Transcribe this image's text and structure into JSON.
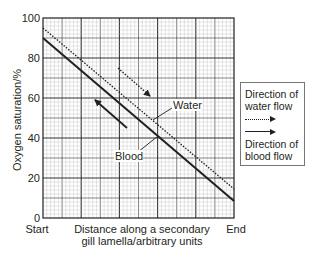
{
  "chart_data": {
    "type": "line",
    "title": "",
    "xlabel": "Distance along a secondary gill lamella/arbitrary units",
    "xlabel_lines": [
      "Distance along a secondary",
      "gill lamella/arbitrary units"
    ],
    "ylabel": "Oxygen saturation/%",
    "x_tick_labels": [
      "Start",
      "End"
    ],
    "x": [
      0,
      10
    ],
    "xlim": [
      0,
      10
    ],
    "ylim": [
      0,
      100
    ],
    "y_ticks": [
      0,
      20,
      40,
      60,
      80,
      100
    ],
    "grid": true,
    "series": [
      {
        "name": "Water",
        "style": "dotted",
        "x": [
          0,
          10
        ],
        "values": [
          95,
          14.5
        ],
        "flow_direction": "start-to-end"
      },
      {
        "name": "Blood",
        "style": "solid",
        "x": [
          0,
          10
        ],
        "values": [
          90,
          8.5
        ],
        "flow_direction": "end-to-start"
      }
    ],
    "annotations": [
      {
        "text": "Water",
        "points_to": "dotted line"
      },
      {
        "text": "Blood",
        "points_to": "solid line"
      }
    ],
    "legend": {
      "position": "right",
      "entries": [
        {
          "label": "Direction of water flow",
          "lines": [
            "Direction of",
            "water flow"
          ],
          "style": "dotted-arrow"
        },
        {
          "label": "Direction of blood flow",
          "lines": [
            "Direction of",
            "blood flow"
          ],
          "style": "solid-arrow"
        }
      ]
    }
  },
  "labels": {
    "y_axis": "Oxygen saturation/%",
    "x_start": "Start",
    "x_end": "End",
    "x_axis_line1": "Distance along a secondary",
    "x_axis_line2": "gill lamella/arbitrary units",
    "annotation_water": "Water",
    "annotation_blood": "Blood",
    "y_ticks": [
      "0",
      "20",
      "40",
      "60",
      "80",
      "100"
    ],
    "legend_water_1": "Direction of",
    "legend_water_2": "water flow",
    "legend_blood_1": "Direction of",
    "legend_blood_2": "blood flow"
  },
  "colors": {
    "ink": "#231f20",
    "grid_minor": "#b5b5b5",
    "grid_major": "#333333"
  }
}
